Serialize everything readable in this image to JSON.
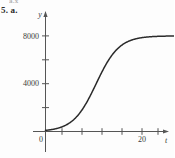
{
  "figure": {
    "clipped_header": "a.x",
    "problem_label": "5. a."
  },
  "chart_data": {
    "type": "line",
    "title": "",
    "subtitle": "",
    "xlabel": "t",
    "ylabel": "y",
    "grid": false,
    "legend": "none",
    "xlim": [
      -2,
      30
    ],
    "ylim": [
      -900,
      9600
    ],
    "xticks": [
      4,
      8,
      12,
      16,
      20,
      24
    ],
    "xtick_labels": [
      "",
      "",
      "",
      "",
      "20",
      ""
    ],
    "yticks": [
      2000,
      4000,
      6000,
      8000
    ],
    "ytick_labels": [
      "",
      "4000",
      "",
      "8000"
    ],
    "origin_label": "0",
    "series": [
      {
        "name": "logistic growth",
        "curve": "logistic",
        "carrying_capacity": 8000,
        "midpoint_t": 10.5,
        "growth_rate": 0.42,
        "color": "#2b2b2b",
        "x": [
          0,
          1,
          2,
          3,
          4,
          5,
          6,
          7,
          8,
          9,
          10,
          11,
          12,
          13,
          14,
          15,
          16,
          17,
          18,
          19,
          20,
          21,
          22,
          23,
          24,
          25,
          26,
          27,
          28
        ],
        "y": [
          96,
          145,
          219,
          329,
          492,
          732,
          1079,
          1570,
          2237,
          3091,
          4098,
          5164,
          6167,
          6999,
          7616,
          8035,
          8300,
          8460,
          8553,
          8606,
          8636,
          8653,
          8662,
          8667,
          8670,
          8672,
          8673,
          8673,
          8674
        ]
      }
    ],
    "annotations": []
  }
}
